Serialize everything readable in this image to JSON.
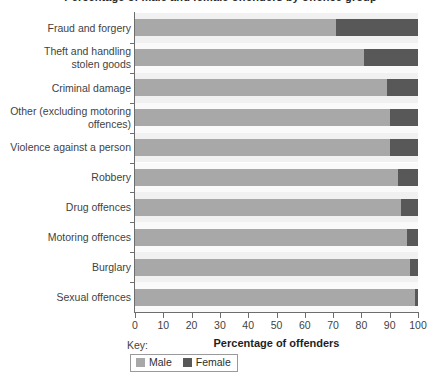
{
  "chart_title": "Percentage of male and female offenders by offence group",
  "x_axis": {
    "title": "Percentage of offenders",
    "ticks": [
      "0",
      "10",
      "20",
      "30",
      "40",
      "50",
      "60",
      "70",
      "80",
      "90",
      "100"
    ]
  },
  "legend": {
    "caption": "Key:",
    "entries": [
      {
        "label": "Male",
        "color": "#a8a8a8"
      },
      {
        "label": "Female",
        "color": "#585858"
      }
    ]
  },
  "colors": {
    "male": "#a8a8a8",
    "female": "#585858",
    "band_even": "#f1f1f1",
    "band_odd": "#fafafa",
    "axis": "#6d6d6d"
  },
  "chart_data": {
    "type": "bar",
    "orientation": "horizontal",
    "stacked": true,
    "stack_total": 100,
    "title": "Percentage of male and female offenders by offence group",
    "xlabel": "Percentage of offenders",
    "ylabel": "",
    "xlim": [
      0,
      100
    ],
    "xticks": [
      0,
      10,
      20,
      30,
      40,
      50,
      60,
      70,
      80,
      90,
      100
    ],
    "grid": false,
    "legend_position": "bottom-left",
    "categories": [
      "Fraud and forgery",
      "Theft and handling\nstolen goods",
      "Criminal damage",
      "Other (excluding motoring\noffences)",
      "Violence against a person",
      "Robbery",
      "Drug offences",
      "Motoring offences",
      "Burglary",
      "Sexual offences"
    ],
    "series": [
      {
        "name": "Male",
        "values": [
          71,
          81,
          89,
          90,
          90,
          93,
          94,
          96,
          97,
          99
        ]
      },
      {
        "name": "Female",
        "values": [
          29,
          19,
          11,
          10,
          10,
          7,
          6,
          4,
          3,
          1
        ]
      }
    ]
  }
}
